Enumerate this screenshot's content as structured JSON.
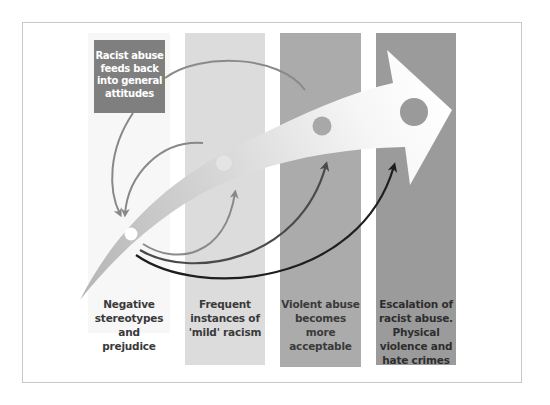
{
  "diagram": {
    "type": "escalation-pyramid-flow",
    "feedback_box": {
      "label": "Racist abuse\nfeeds back\ninto general\nattitudes",
      "color": "#7f7f7f"
    },
    "stages": [
      {
        "label": "Negative\nstereotypes\nand\nprejudice",
        "color": "#f7f7f7",
        "node_color": "#ffffff"
      },
      {
        "label": "Frequent\ninstances of\n'mild' racism",
        "color": "#dcdcdc",
        "node_color": "#e4e4e4"
      },
      {
        "label": "Violent abuse\nbecomes more\nacceptable",
        "color": "#ababab",
        "node_color": "#a8a8a8"
      },
      {
        "label": "Escalation of\nracist abuse.\nPhysical\nviolence and\nhate crimes",
        "color": "#9b9b9b",
        "node_color": "#9a9a9a"
      }
    ],
    "main_arrow": {
      "direction": "left-to-right rising",
      "gradient_from": "#b4b4b4",
      "gradient_to": "#ffffff"
    },
    "connectors": [
      {
        "from": "stage-1",
        "to": "stage-2",
        "color": "#8a8a8a"
      },
      {
        "from": "stage-1",
        "to": "stage-3",
        "color": "#4a4a4a"
      },
      {
        "from": "stage-1",
        "to": "stage-4",
        "color": "#1e1e1e"
      },
      {
        "from": "feedback-box",
        "to": "stage-1",
        "color": "#888888"
      },
      {
        "from": "stage-3",
        "to": "stage-1",
        "color": "#888888",
        "via": "feedback-box"
      },
      {
        "from": "stage-2",
        "to": "stage-1",
        "color": "#888888"
      }
    ]
  }
}
